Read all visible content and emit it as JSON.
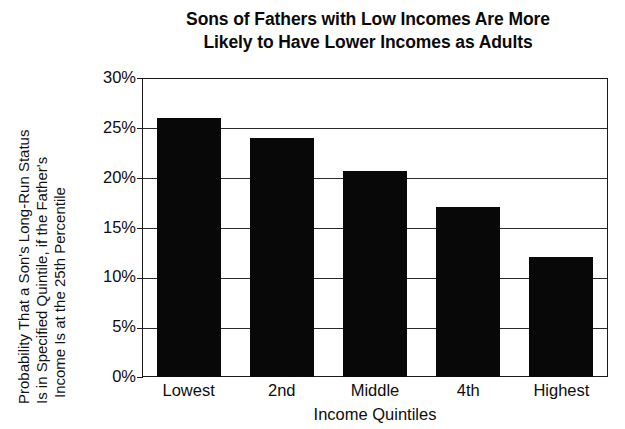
{
  "chart_data": {
    "type": "bar",
    "title": "Sons of Fathers with Low Incomes Are More Likely to Have Lower Incomes as Adults",
    "title_lines": [
      "Sons of Fathers with Low Incomes Are More",
      "Likely to Have Lower Incomes as Adults"
    ],
    "categories": [
      "Lowest",
      "2nd",
      "Middle",
      "4th",
      "Highest"
    ],
    "values": [
      26.0,
      24.0,
      20.7,
      17.1,
      12.0
    ],
    "value_labels": [
      "26%",
      "24%",
      "20.7%",
      "17.1%",
      "12%"
    ],
    "xlabel": "Income Quintiles",
    "ylabel": "Probability That a Son's Long-Run Status Is in Specified Quintile, if the Father's Income Is at the 25th Percentile",
    "ylabel_lines": [
      "Probability That a Son's Long-Run Status",
      "Is in Specified Quintile, if the Father's",
      "Income Is at the 25th Percentile"
    ],
    "ylim": [
      0,
      30
    ],
    "ytick_values": [
      30,
      25,
      20,
      15,
      10,
      5,
      0
    ],
    "ytick_labels": [
      "30%",
      "25%",
      "20%",
      "15%",
      "10%",
      "5%",
      "0%"
    ],
    "grid": true,
    "legend": "none",
    "bar_color": "#080808",
    "axis_color": "#1a1a1a",
    "background_color": "#ffffff"
  }
}
